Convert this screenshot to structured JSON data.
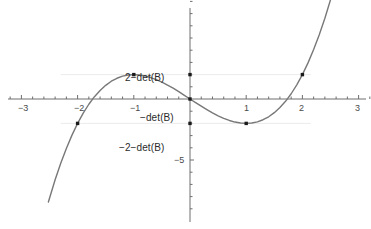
{
  "chart_data": {
    "type": "line",
    "title": "",
    "subtitle": "",
    "xlabel": "",
    "ylabel": "",
    "xlim": [
      -3.35,
      3.35
    ],
    "ylim": [
      -10.6,
      8.6
    ],
    "grid": false,
    "legend": null,
    "axis_color": "#6e6e6e",
    "curve_color": "#787878",
    "point_color": "#1a1a1a",
    "series": [
      {
        "name": "cubic",
        "expression": "y = x^3 - 3x - 2*det(B)",
        "x_domain": [
          -2.52,
          2.5
        ],
        "points_x": [
          -2.52,
          -2.4,
          -2.3,
          -2.2,
          -2.1,
          -2.0,
          -1.9,
          -1.8,
          -1.7,
          -1.6,
          -1.5,
          -1.4,
          -1.3,
          -1.2,
          -1.1,
          -1.0,
          -0.9,
          -0.8,
          -0.7,
          -0.6,
          -0.5,
          -0.4,
          -0.3,
          -0.2,
          -0.1,
          0.0,
          0.1,
          0.2,
          0.3,
          0.4,
          0.5,
          0.6,
          0.7,
          0.8,
          0.9,
          1.0,
          1.1,
          1.2,
          1.3,
          1.4,
          1.5,
          1.6,
          1.7,
          1.8,
          1.9,
          2.0,
          2.1,
          2.2,
          2.3,
          2.4,
          2.5
        ],
        "points_y": [
          -8.44,
          -6.62,
          -5.27,
          -4.05,
          -2.96,
          -2.0,
          -1.16,
          -0.43,
          0.19,
          0.7,
          1.12,
          1.46,
          1.7,
          1.87,
          1.97,
          2.0,
          1.97,
          1.89,
          1.76,
          1.58,
          1.38,
          1.14,
          0.89,
          0.61,
          0.3,
          0.0,
          -0.3,
          -0.59,
          -0.87,
          -1.14,
          -1.38,
          -1.58,
          -1.76,
          -1.89,
          -1.97,
          -2.0,
          -1.97,
          -1.87,
          -1.7,
          -1.46,
          -1.12,
          -0.7,
          -0.19,
          0.43,
          1.16,
          2.0,
          2.96,
          4.05,
          5.27,
          6.62,
          8.13
        ]
      }
    ],
    "marked_points": [
      {
        "x": -2.0,
        "y": -2.0,
        "label": ""
      },
      {
        "x": -1.0,
        "y": 2.0,
        "label": ""
      },
      {
        "x": 0.0,
        "y": 2.0,
        "label": "2-det(B)"
      },
      {
        "x": 0.0,
        "y": 0.0,
        "label": "-det(B)"
      },
      {
        "x": 0.0,
        "y": -2.0,
        "label": "-2-det(B)"
      },
      {
        "x": 1.0,
        "y": -2.0,
        "label": ""
      },
      {
        "x": 2.0,
        "y": 2.0,
        "label": ""
      }
    ],
    "x_ticks": [
      -3,
      -2,
      -1,
      1,
      2,
      3
    ],
    "x_tick_labels": [
      "−3",
      "−2",
      "−1",
      "1",
      "2",
      "3"
    ],
    "x_minor_step": 0.2,
    "y_ticks": [
      -5
    ],
    "y_tick_labels": [
      "−5"
    ],
    "y_minor_step": 1,
    "annotations": [
      {
        "text": "2−det(B)",
        "x": -0.62,
        "y": 2.5,
        "align": "right"
      },
      {
        "text": "−det(B)",
        "x": -0.22,
        "y": -0.55,
        "align": "right"
      },
      {
        "text": "−2−det(B)",
        "x": -0.62,
        "y": -3.1,
        "align": "right"
      },
      {
        "text": "−5",
        "x": -0.14,
        "y": -4.6,
        "align": "right"
      }
    ]
  },
  "labels": {
    "x_neg3": "−3",
    "x_neg2": "−2",
    "x_neg1": "−1",
    "x_pos1": "1",
    "x_pos2": "2",
    "x_pos3": "3",
    "ann_two_minus_det": "2−det(B)",
    "ann_minus_det": "−det(B)",
    "ann_minus_two_minus_det": "−2−det(B)",
    "ann_minus_five": "−5"
  }
}
